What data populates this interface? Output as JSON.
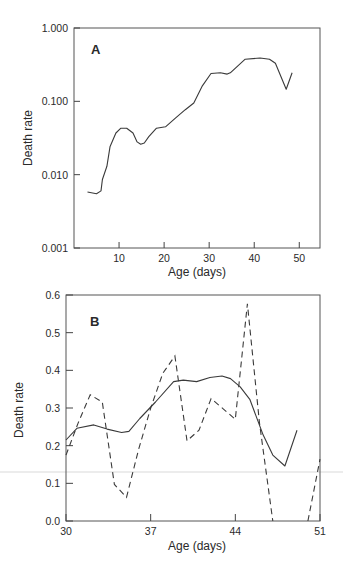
{
  "figure": {
    "panels": [
      "A",
      "B"
    ]
  },
  "chart_data": [
    {
      "type": "line",
      "panel_label": "A",
      "title": "",
      "xlabel": "Age (days)",
      "ylabel": "Death rate",
      "yscale": "log",
      "xlim": [
        0,
        55
      ],
      "ylim": [
        0.001,
        1.0
      ],
      "x_ticks": [
        10,
        20,
        30,
        40,
        50
      ],
      "x_tick_labels": [
        "10",
        "20",
        "30",
        "40",
        "50"
      ],
      "y_ticks": [
        0.001,
        0.01,
        0.1,
        1.0
      ],
      "y_tick_labels": [
        "0.001",
        "0.010",
        "0.100",
        "1.000"
      ],
      "grid": false,
      "series": [
        {
          "name": "death rate",
          "style": "solid",
          "x": [
            3,
            5,
            6,
            6.3,
            7.3,
            8,
            9.3,
            10.4,
            11.7,
            13.1,
            14,
            14.8,
            15.6,
            16.6,
            18.3,
            20.3,
            22.5,
            24.7,
            26.6,
            28.4,
            30.4,
            32.5,
            34,
            34.7,
            38,
            41.3,
            43.4,
            44.7,
            47.1,
            48.4
          ],
          "values": [
            0.0058,
            0.0055,
            0.006,
            0.0086,
            0.013,
            0.024,
            0.037,
            0.043,
            0.043,
            0.037,
            0.028,
            0.026,
            0.027,
            0.033,
            0.043,
            0.045,
            0.059,
            0.077,
            0.095,
            0.16,
            0.24,
            0.245,
            0.235,
            0.245,
            0.375,
            0.39,
            0.375,
            0.33,
            0.146,
            0.245
          ]
        }
      ]
    },
    {
      "type": "line",
      "panel_label": "B",
      "title": "",
      "xlabel": "Age (days)",
      "ylabel": "Death rate",
      "yscale": "linear",
      "xlim": [
        30,
        51
      ],
      "ylim": [
        0.0,
        0.6
      ],
      "x_ticks": [
        30,
        37,
        44,
        51
      ],
      "x_tick_labels": [
        "30",
        "37",
        "44",
        "51"
      ],
      "y_ticks": [
        0.0,
        0.1,
        0.2,
        0.3,
        0.4,
        0.5,
        0.6
      ],
      "y_tick_labels": [
        "0.0",
        "0.1",
        "0.2",
        "0.3",
        "0.4",
        "0.5",
        "0.6"
      ],
      "grid": false,
      "series": [
        {
          "name": "smoothed death rate",
          "style": "solid",
          "x": [
            30,
            30.9,
            32.3,
            33.4,
            34.6,
            35.2,
            36.1,
            37.4,
            38.9,
            39.7,
            40.8,
            41.9,
            42.9,
            43.6,
            44.4,
            45.2,
            46.3,
            47.1,
            48.1,
            49.1
          ],
          "values": [
            0.215,
            0.246,
            0.255,
            0.244,
            0.235,
            0.238,
            0.272,
            0.316,
            0.37,
            0.374,
            0.37,
            0.381,
            0.385,
            0.378,
            0.356,
            0.323,
            0.228,
            0.175,
            0.146,
            0.241
          ]
        },
        {
          "name": "daily death rate",
          "style": "dashed",
          "x": [
            30,
            31,
            32,
            33,
            34,
            35,
            36,
            37,
            38,
            39,
            40,
            41,
            42,
            43,
            44,
            45,
            46,
            47.1
          ],
          "values": [
            0.175,
            0.26,
            0.335,
            0.316,
            0.097,
            0.063,
            0.19,
            0.3,
            0.392,
            0.438,
            0.213,
            0.241,
            0.325,
            0.298,
            0.27,
            0.577,
            0.26,
            0.0
          ]
        },
        {
          "name": "daily death rate (continued)",
          "style": "dashed",
          "x": [
            50,
            51
          ],
          "values": [
            0.0,
            0.164
          ]
        }
      ]
    }
  ]
}
